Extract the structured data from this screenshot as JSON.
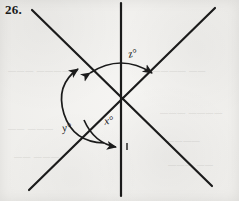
{
  "figure": {
    "problem_number": "26.",
    "background_color": "#f2f1ee",
    "ink_color": "#1b1b1b",
    "labels": {
      "x": "x°",
      "y": "y°",
      "z": "z°"
    },
    "geometry": {
      "intersection_point": {
        "x": 120,
        "y": 99
      },
      "lines": [
        {
          "name": "vertical-line",
          "x1": 121,
          "y1": 3,
          "x2": 121,
          "y2": 196
        },
        {
          "name": "diagonal-down-right-line",
          "x1": 32,
          "y1": 10,
          "x2": 212,
          "y2": 186
        },
        {
          "name": "diagonal-up-right-line",
          "x1": 29,
          "y1": 190,
          "x2": 215,
          "y2": 8
        }
      ],
      "arcs": [
        {
          "name": "angle-arc-x",
          "label": "x°",
          "arrowheads": "single",
          "from_ray": "diagonal-down-left-ray",
          "to_ray": "vertical-down-ray"
        },
        {
          "name": "angle-arc-y",
          "label": "y°",
          "arrowheads": "double",
          "from_ray": "vertical-down-ray",
          "to_ray": "diagonal-up-left-ray",
          "reflex": true
        },
        {
          "name": "angle-arc-z",
          "label": "z°",
          "arrowheads": "double",
          "from_ray": "diagonal-up-left-ray",
          "to_ray": "diagonal-up-right-ray"
        }
      ]
    }
  },
  "bleed_through": [
    {
      "text": "———  —————",
      "left": 8,
      "top": 66
    },
    {
      "text": "————  ——",
      "left": 152,
      "top": 66
    },
    {
      "text": "——  ———",
      "left": 8,
      "top": 124
    },
    {
      "text": "———  ————",
      "left": 160,
      "top": 108
    },
    {
      "text": "————",
      "left": 166,
      "top": 136
    },
    {
      "text": "——  ———",
      "left": 14,
      "top": 152
    },
    {
      "text": "———  ——",
      "left": 168,
      "top": 160
    }
  ]
}
